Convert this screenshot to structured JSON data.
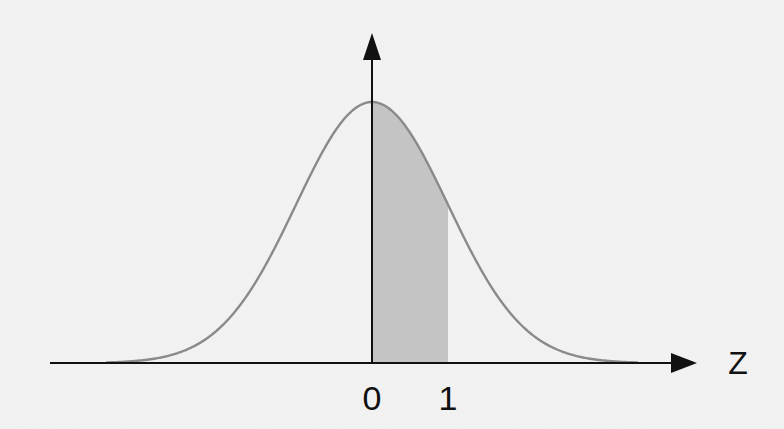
{
  "diagram": {
    "axis": {
      "x_label": "Z",
      "tick_labels": [
        "0",
        "1"
      ]
    },
    "curve": {
      "type": "normal",
      "mean": 0,
      "sd": 1,
      "shaded_from": 0,
      "shaded_to": 1
    },
    "colors": {
      "background": "#f3f3f3",
      "axis": "#111111",
      "curve": "#8a8a8a",
      "shade": "#c4c4c4",
      "text": "#111111"
    }
  }
}
